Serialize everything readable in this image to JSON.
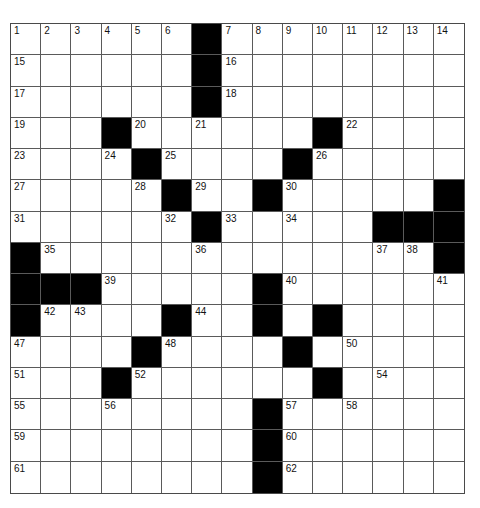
{
  "puzzle": {
    "rows": 15,
    "cols": 15,
    "colors": {
      "black_square": "#000000",
      "white_square": "#ffffff",
      "grid_line": "#5a5a5a"
    },
    "layout": [
      "......#........",
      "......#........",
      "......#........",
      "...#......#....",
      "....#....#.....",
      ".....#..#.....#",
      "......#.....###",
      "#.............#",
      "###.....#......",
      "#....#..#.#....",
      "....#....#.....",
      "...#......#....",
      "........#......",
      "........#......",
      "........#......"
    ],
    "numbers": [
      {
        "r": 0,
        "c": 0,
        "n": "1"
      },
      {
        "r": 0,
        "c": 1,
        "n": "2"
      },
      {
        "r": 0,
        "c": 2,
        "n": "3"
      },
      {
        "r": 0,
        "c": 3,
        "n": "4"
      },
      {
        "r": 0,
        "c": 4,
        "n": "5"
      },
      {
        "r": 0,
        "c": 5,
        "n": "6"
      },
      {
        "r": 0,
        "c": 7,
        "n": "7"
      },
      {
        "r": 0,
        "c": 8,
        "n": "8"
      },
      {
        "r": 0,
        "c": 9,
        "n": "9"
      },
      {
        "r": 0,
        "c": 10,
        "n": "10"
      },
      {
        "r": 0,
        "c": 11,
        "n": "11"
      },
      {
        "r": 0,
        "c": 12,
        "n": "12"
      },
      {
        "r": 0,
        "c": 13,
        "n": "13"
      },
      {
        "r": 0,
        "c": 14,
        "n": "14"
      },
      {
        "r": 1,
        "c": 0,
        "n": "15"
      },
      {
        "r": 1,
        "c": 7,
        "n": "16"
      },
      {
        "r": 2,
        "c": 0,
        "n": "17"
      },
      {
        "r": 2,
        "c": 7,
        "n": "18"
      },
      {
        "r": 3,
        "c": 0,
        "n": "19"
      },
      {
        "r": 3,
        "c": 4,
        "n": "20"
      },
      {
        "r": 3,
        "c": 6,
        "n": "21"
      },
      {
        "r": 3,
        "c": 11,
        "n": "22"
      },
      {
        "r": 4,
        "c": 0,
        "n": "23"
      },
      {
        "r": 4,
        "c": 3,
        "n": "24"
      },
      {
        "r": 4,
        "c": 5,
        "n": "25"
      },
      {
        "r": 4,
        "c": 10,
        "n": "26"
      },
      {
        "r": 5,
        "c": 0,
        "n": "27"
      },
      {
        "r": 5,
        "c": 4,
        "n": "28"
      },
      {
        "r": 5,
        "c": 6,
        "n": "29"
      },
      {
        "r": 5,
        "c": 9,
        "n": "30"
      },
      {
        "r": 6,
        "c": 0,
        "n": "31"
      },
      {
        "r": 6,
        "c": 5,
        "n": "32"
      },
      {
        "r": 6,
        "c": 7,
        "n": "33"
      },
      {
        "r": 6,
        "c": 9,
        "n": "34"
      },
      {
        "r": 7,
        "c": 1,
        "n": "35"
      },
      {
        "r": 7,
        "c": 6,
        "n": "36"
      },
      {
        "r": 7,
        "c": 12,
        "n": "37"
      },
      {
        "r": 7,
        "c": 13,
        "n": "38"
      },
      {
        "r": 8,
        "c": 3,
        "n": "39"
      },
      {
        "r": 8,
        "c": 9,
        "n": "40"
      },
      {
        "r": 8,
        "c": 14,
        "n": "41"
      },
      {
        "r": 9,
        "c": 1,
        "n": "42"
      },
      {
        "r": 9,
        "c": 2,
        "n": "43"
      },
      {
        "r": 9,
        "c": 6,
        "n": "44"
      },
      {
        "r": 9,
        "c": 8,
        "n": "45"
      },
      {
        "r": 9,
        "c": 10,
        "n": "46"
      },
      {
        "r": 10,
        "c": 0,
        "n": "47"
      },
      {
        "r": 10,
        "c": 5,
        "n": "48"
      },
      {
        "r": 10,
        "c": 9,
        "n": "49"
      },
      {
        "r": 10,
        "c": 11,
        "n": "50"
      },
      {
        "r": 11,
        "c": 0,
        "n": "51"
      },
      {
        "r": 11,
        "c": 4,
        "n": "52"
      },
      {
        "r": 11,
        "c": 10,
        "n": "53"
      },
      {
        "r": 11,
        "c": 12,
        "n": "54"
      },
      {
        "r": 12,
        "c": 0,
        "n": "55"
      },
      {
        "r": 12,
        "c": 3,
        "n": "56"
      },
      {
        "r": 12,
        "c": 9,
        "n": "57"
      },
      {
        "r": 12,
        "c": 11,
        "n": "58"
      },
      {
        "r": 13,
        "c": 0,
        "n": "59"
      },
      {
        "r": 13,
        "c": 9,
        "n": "60"
      },
      {
        "r": 14,
        "c": 0,
        "n": "61"
      },
      {
        "r": 14,
        "c": 9,
        "n": "62"
      }
    ]
  }
}
